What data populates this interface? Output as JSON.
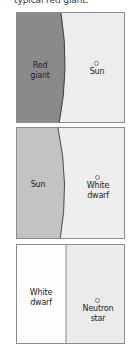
{
  "caption": "typical red giant.",
  "panels": [
    {
      "left_label": [
        "Red",
        "giant"
      ],
      "right_marker_label": [
        "Sun"
      ],
      "left_color": "#8a8a8a",
      "right_color": "#ededed",
      "boundary": "curved"
    },
    {
      "left_label": [
        "Sun"
      ],
      "right_marker_label": [
        "White",
        "dwarf"
      ],
      "left_color": "#c3c3c3",
      "right_color": "#eeeeee",
      "boundary": "curved"
    },
    {
      "left_label": [
        "White",
        "dwarf"
      ],
      "right_marker_label": [
        "Neutron",
        "star"
      ],
      "left_color": "#fdfdfd",
      "right_color": "#ebebeb",
      "boundary": "straight"
    }
  ],
  "colors": {
    "border": "#8c8c8c",
    "edge_line": "#4a4a4a"
  }
}
